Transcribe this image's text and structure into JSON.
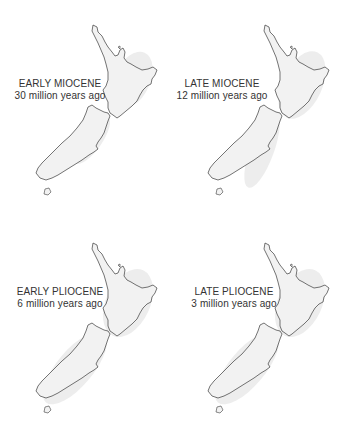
{
  "figure": {
    "panels": [
      {
        "era": "EARLY MIOCENE",
        "age": "30 million years ago"
      },
      {
        "era": "LATE MIOCENE",
        "age": "12 million years ago"
      },
      {
        "era": "EARLY PLIOCENE",
        "age": "6 million years ago"
      },
      {
        "era": "LATE PLIOCENE",
        "age": "3 million years ago"
      }
    ]
  },
  "colors": {
    "background": "#ffffff",
    "outline": "#3a3a3a",
    "land_shading": "#e6e6e6",
    "text": "#333333"
  }
}
